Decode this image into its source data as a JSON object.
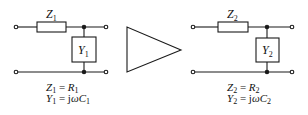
{
  "diagram": {
    "type": "circuit-transformation",
    "left_network": {
      "series_element": {
        "symbol": "Z",
        "subscript": "1"
      },
      "shunt_element": {
        "symbol": "Y",
        "subscript": "1"
      },
      "equations": [
        {
          "lhs": "Z",
          "lhs_sub": "1",
          "op": " = ",
          "rhs": "R",
          "rhs_sub": "1",
          "rhs_prefix": ""
        },
        {
          "lhs": "Y",
          "lhs_sub": "1",
          "op": " = ",
          "rhs": "ωC",
          "rhs_sub": "1",
          "rhs_prefix": "j"
        }
      ]
    },
    "transform_symbol": "triangle-arrow",
    "right_network": {
      "series_element": {
        "symbol": "Z",
        "subscript": "2"
      },
      "shunt_element": {
        "symbol": "Y",
        "subscript": "2"
      },
      "equations": [
        {
          "lhs": "Z",
          "lhs_sub": "2",
          "op": " = ",
          "rhs": "R",
          "rhs_sub": "2",
          "rhs_prefix": ""
        },
        {
          "lhs": "Y",
          "lhs_sub": "2",
          "op": " = ",
          "rhs": "ωC",
          "rhs_sub": "2",
          "rhs_prefix": "j"
        }
      ]
    },
    "colors": {
      "stroke": "#1a1a1a",
      "background": "#ffffff"
    }
  }
}
